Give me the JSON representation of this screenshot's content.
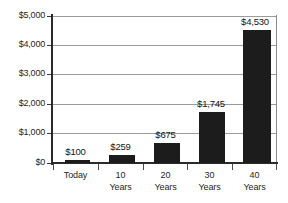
{
  "chart_data": {
    "type": "bar",
    "title": "",
    "subtitle": "",
    "xlabel": "",
    "ylabel": "",
    "categories": [
      "Today",
      "10 Years",
      "20 Years",
      "30 Years",
      "40 Years"
    ],
    "category_lines": [
      {
        "line1": "Today",
        "line2": ""
      },
      {
        "line1": "10",
        "line2": "Years"
      },
      {
        "line1": "20",
        "line2": "Years"
      },
      {
        "line1": "30",
        "line2": "Years"
      },
      {
        "line1": "40",
        "line2": "Years"
      }
    ],
    "values": [
      100,
      259,
      675,
      1745,
      4530
    ],
    "value_labels": [
      "$100",
      "$259",
      "$675",
      "$1,745",
      "$4,530"
    ],
    "ylim": [
      0,
      5000
    ],
    "ytick_values": [
      0,
      1000,
      2000,
      3000,
      4000,
      5000
    ],
    "ytick_labels": [
      "$0",
      "$1,000",
      "$2,000",
      "$3,000",
      "$4,000",
      "$5,000"
    ],
    "grid": true,
    "grid_axis": "y",
    "legend": false,
    "legend_position": "none",
    "bar_color": "#1c1c1c",
    "gridline_color": "#9b9b9b",
    "axis_color": "#2b2b2b",
    "background_color": "#ffffff",
    "text_color": "#1f1f1f"
  }
}
